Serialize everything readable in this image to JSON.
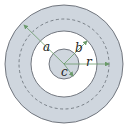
{
  "diagram": {
    "labels": {
      "a": "a",
      "b": "b",
      "c": "c",
      "r": "r"
    },
    "colors": {
      "shell_fill": "#cfd6de",
      "core_fill": "#cfd6de",
      "outline": "#555b63",
      "arrow": "#6a9a6a",
      "background": "#ffffff"
    }
  }
}
